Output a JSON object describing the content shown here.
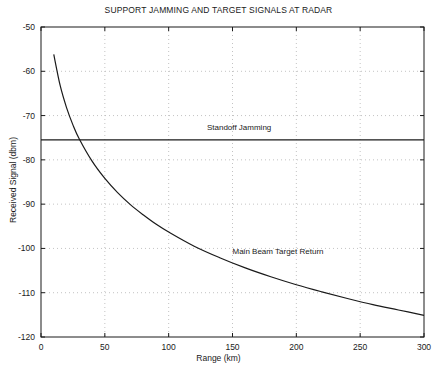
{
  "chart_data": {
    "type": "line",
    "title": "SUPPORT JAMMING AND TARGET SIGNALS AT RADAR",
    "xlabel": "Range (km)",
    "ylabel": "Received Signal (dbm)",
    "xlim": [
      0,
      300
    ],
    "ylim": [
      -120,
      -50
    ],
    "xticks": [
      0,
      50,
      100,
      150,
      200,
      250,
      300
    ],
    "yticks": [
      -50,
      -60,
      -70,
      -80,
      -90,
      -100,
      -110,
      -120
    ],
    "xtick_labels": [
      "0",
      "50",
      "100",
      "150",
      "200",
      "250",
      "300"
    ],
    "ytick_labels": [
      "-50",
      "-60",
      "-70",
      "-80",
      "-90",
      "-100",
      "-110",
      "-120"
    ],
    "grid": true,
    "grid_style": "dotted",
    "legend": "none",
    "series": [
      {
        "name": "Standoff Jamming",
        "annotation": "Standoff Jamming",
        "annotation_x": 130,
        "annotation_y": -73.0,
        "type": "constant",
        "value": -75.5,
        "x": [
          0,
          300
        ],
        "values": [
          -75.5,
          -75.5
        ]
      },
      {
        "name": "Main Beam Target Return",
        "annotation": "Main Beam Target Return",
        "annotation_x": 150,
        "annotation_y": -101.0,
        "type": "curve",
        "x": [
          10,
          15,
          20,
          25,
          30,
          40,
          50,
          60,
          70,
          80,
          90,
          100,
          120,
          140,
          160,
          180,
          200,
          220,
          240,
          260,
          280,
          300
        ],
        "values": [
          -56.2,
          -63.2,
          -68.2,
          -72.1,
          -75.3,
          -80.3,
          -84.2,
          -87.4,
          -90.1,
          -92.4,
          -94.5,
          -96.3,
          -99.5,
          -102.1,
          -104.4,
          -106.4,
          -108.2,
          -109.8,
          -111.3,
          -112.7,
          -113.9,
          -115.1
        ]
      }
    ]
  },
  "plot_geometry": {
    "left": 41,
    "right": 424,
    "top": 27,
    "bottom": 337
  },
  "colors": {
    "axis": "#1a1a1a",
    "grid": "#b4b4b4",
    "curve": "#1a1a1a",
    "background": "#ffffff"
  }
}
